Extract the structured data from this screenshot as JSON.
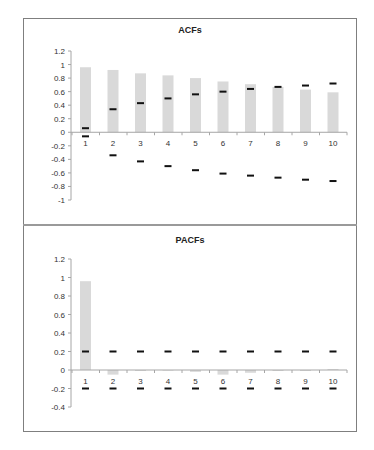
{
  "chart_data": [
    {
      "type": "bar",
      "title": "ACFs",
      "xlabel": "",
      "ylabel": "",
      "categories": [
        "1",
        "2",
        "3",
        "4",
        "5",
        "6",
        "7",
        "8",
        "9",
        "10"
      ],
      "ylim": [
        -1,
        1.2
      ],
      "yticks": [
        "1.2",
        "1",
        "0.8",
        "0.6",
        "0.4",
        "0.2",
        "0",
        "-0.2",
        "-0.4",
        "-0.6",
        "-0.8",
        "-1"
      ],
      "series": [
        {
          "name": "ACF",
          "values": [
            0.96,
            0.92,
            0.87,
            0.84,
            0.8,
            0.75,
            0.71,
            0.67,
            0.63,
            0.59
          ]
        },
        {
          "name": "Upper bound",
          "values": [
            0.06,
            0.34,
            0.43,
            0.5,
            0.56,
            0.6,
            0.64,
            0.67,
            0.69,
            0.72
          ]
        },
        {
          "name": "Lower bound",
          "values": [
            -0.06,
            -0.34,
            -0.43,
            -0.5,
            -0.56,
            -0.61,
            -0.64,
            -0.67,
            -0.7,
            -0.72
          ]
        }
      ],
      "grid": false,
      "legend": "none"
    },
    {
      "type": "bar",
      "title": "PACFs",
      "xlabel": "",
      "ylabel": "",
      "categories": [
        "1",
        "2",
        "3",
        "4",
        "5",
        "6",
        "7",
        "8",
        "9",
        "10"
      ],
      "ylim": [
        -0.4,
        1.2
      ],
      "yticks": [
        "1.2",
        "1",
        "0.8",
        "0.6",
        "0.4",
        "0.2",
        "0",
        "-0.2",
        "-0.4"
      ],
      "series": [
        {
          "name": "PACF",
          "values": [
            0.96,
            -0.05,
            -0.01,
            0.0,
            -0.02,
            -0.05,
            -0.03,
            -0.01,
            -0.01,
            0.01
          ]
        },
        {
          "name": "Upper bound",
          "values": [
            0.2,
            0.2,
            0.2,
            0.2,
            0.2,
            0.2,
            0.2,
            0.2,
            0.2,
            0.2
          ]
        },
        {
          "name": "Lower bound",
          "values": [
            -0.2,
            -0.2,
            -0.2,
            -0.2,
            -0.2,
            -0.2,
            -0.2,
            -0.2,
            -0.2,
            -0.2
          ]
        }
      ],
      "grid": false,
      "legend": "none"
    }
  ],
  "colors": {
    "bar": "#d9d9d9",
    "bound": "#111111",
    "axis": "#a6a6a6",
    "frame": "#7f7f7f"
  }
}
